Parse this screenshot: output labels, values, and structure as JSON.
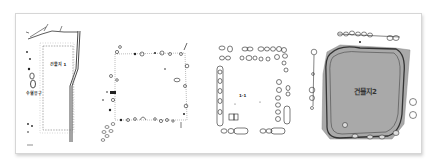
{
  "figure": {
    "panels": [
      {
        "id": "plan-1",
        "label": "건물지 1",
        "sublabel": "수혈유구"
      },
      {
        "id": "plan-2",
        "label": ""
      },
      {
        "id": "plan-3",
        "label": "1-1"
      },
      {
        "id": "plan-4",
        "label": "건물지2"
      }
    ]
  },
  "colors": {
    "frame_border": "#d6d6d6",
    "line": "#222222",
    "shaded_area": "#a9a9a9"
  }
}
